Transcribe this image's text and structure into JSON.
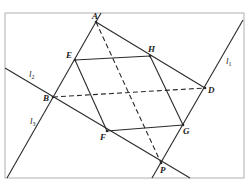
{
  "diagram": {
    "type": "geometry",
    "frame": {
      "x": 5,
      "y": 13,
      "width": 239,
      "height": 165,
      "color": "#b0b0b0"
    },
    "line_color": "#2a2a2a",
    "points": {
      "A": {
        "label": "A",
        "x": 96,
        "y": 22,
        "lx": 92,
        "ly": 19
      },
      "E": {
        "label": "E",
        "x": 75,
        "y": 60,
        "lx": 66,
        "ly": 58
      },
      "H": {
        "label": "H",
        "x": 150,
        "y": 56,
        "lx": 148,
        "ly": 52
      },
      "D": {
        "label": "D",
        "x": 205,
        "y": 88,
        "lx": 208,
        "ly": 93
      },
      "B": {
        "label": "B",
        "x": 53,
        "y": 97,
        "lx": 43,
        "ly": 101
      },
      "F": {
        "label": "F",
        "x": 107,
        "y": 131,
        "lx": 100,
        "ly": 140
      },
      "G": {
        "label": "G",
        "x": 183,
        "y": 125,
        "lx": 183,
        "ly": 134
      },
      "P": {
        "label": "P",
        "x": 161,
        "y": 163,
        "lx": 160,
        "ly": 173
      }
    },
    "lines": [
      {
        "name": "l1",
        "label": "l",
        "sub": "1",
        "x1": 243,
        "y1": 20,
        "x2": 152,
        "y2": 178,
        "lx": 226,
        "ly": 64
      },
      {
        "name": "l2",
        "label": "l",
        "sub": "2",
        "x1": 5,
        "y1": 68,
        "x2": 190,
        "y2": 178,
        "lx": 29,
        "ly": 77
      },
      {
        "name": "l3",
        "label": "l",
        "sub": "3",
        "x1": 7,
        "y1": 178,
        "x2": 101,
        "y2": 13,
        "lx": 30,
        "ly": 124
      }
    ],
    "segments": [
      {
        "name": "AD",
        "from": "A",
        "to": "D",
        "style": "solid"
      },
      {
        "name": "EH",
        "from": "E",
        "to": "H",
        "style": "solid"
      },
      {
        "name": "HG",
        "from": "H",
        "to": "G",
        "style": "solid"
      },
      {
        "name": "GF",
        "from": "G",
        "to": "F",
        "style": "solid"
      },
      {
        "name": "FE",
        "from": "F",
        "to": "E",
        "style": "solid"
      },
      {
        "name": "AP",
        "from": "A",
        "to": "P",
        "style": "dashed"
      },
      {
        "name": "BD",
        "from": "B",
        "to": "D",
        "style": "dashed"
      }
    ]
  }
}
